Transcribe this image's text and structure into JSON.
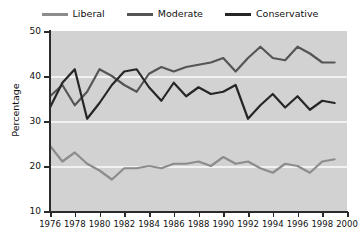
{
  "chart_data": {
    "type": "line",
    "title": "",
    "xlabel": "",
    "ylabel": "Percentage",
    "xlim": [
      1976,
      2000
    ],
    "ylim": [
      0,
      50
    ],
    "yticks": [
      10,
      20,
      30,
      40,
      50
    ],
    "xticks": [
      1976,
      1978,
      1980,
      1982,
      1984,
      1986,
      1988,
      1990,
      1992,
      1994,
      1996,
      1998,
      2000
    ],
    "grid": true,
    "legend_position": "top-center",
    "plot_background": "#d2d2d2",
    "gridline_color": "#f2f2f2",
    "x": [
      1976,
      1977,
      1978,
      1979,
      1980,
      1981,
      1982,
      1983,
      1984,
      1985,
      1986,
      1987,
      1988,
      1989,
      1990,
      1991,
      1992,
      1993,
      1994,
      1995,
      1996,
      1997,
      1998,
      1999
    ],
    "series": [
      {
        "name": "Liberal",
        "color": "#8c8c8c",
        "values": [
          24.5,
          21.0,
          23.0,
          20.5,
          19.0,
          17.0,
          19.5,
          19.5,
          20.0,
          19.5,
          20.5,
          20.5,
          21.0,
          20.0,
          22.0,
          20.5,
          21.0,
          19.5,
          18.5,
          20.5,
          20.0,
          18.5,
          21.0,
          21.5
        ]
      },
      {
        "name": "Moderate",
        "color": "#555555",
        "values": [
          35.5,
          38.0,
          33.5,
          36.5,
          41.5,
          40.0,
          38.0,
          36.5,
          40.5,
          42.0,
          41.0,
          42.0,
          42.5,
          43.0,
          44.0,
          41.0,
          44.0,
          46.5,
          44.0,
          43.5,
          46.5,
          45.0,
          43.0,
          43.0
        ]
      },
      {
        "name": "Conservative",
        "color": "#262626",
        "values": [
          33.0,
          38.5,
          41.5,
          30.5,
          34.0,
          38.0,
          41.0,
          41.5,
          37.5,
          34.5,
          38.5,
          35.5,
          37.5,
          36.0,
          36.5,
          38.0,
          30.5,
          33.5,
          36.0,
          33.0,
          35.5,
          32.5,
          34.5,
          34.0
        ]
      }
    ]
  },
  "legend": {
    "items": [
      {
        "label": "Liberal"
      },
      {
        "label": "Moderate"
      },
      {
        "label": "Conservative"
      }
    ]
  },
  "axes": {
    "y_title": "Percentage",
    "y_tick_labels": [
      "50",
      "40",
      "30",
      "20",
      "10"
    ],
    "x_tick_labels": [
      "1976",
      "1978",
      "1980",
      "1982",
      "1984",
      "1986",
      "1988",
      "1990",
      "1992",
      "1994",
      "1996",
      "1998",
      "2000"
    ]
  }
}
